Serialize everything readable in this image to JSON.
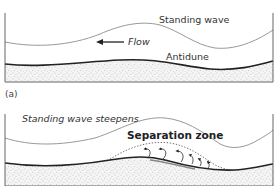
{
  "figure": {
    "panels": [
      {
        "id": "a",
        "label": "(a)",
        "water_surface_label": "Standing wave",
        "flow_label": "Flow",
        "flow_direction": "left",
        "bedform_label": "Antidune"
      },
      {
        "id": "b",
        "water_surface_label": "Standing wave steepens",
        "zone_label": "Separation zone"
      }
    ],
    "colors": {
      "water_surface": "#8c8c8c",
      "bed_surface": "#222222",
      "sediment_fill": "#f2f2f2",
      "sediment_dots": "#9a9a9a",
      "frame": "#555555",
      "separation_line": "#333333"
    }
  }
}
